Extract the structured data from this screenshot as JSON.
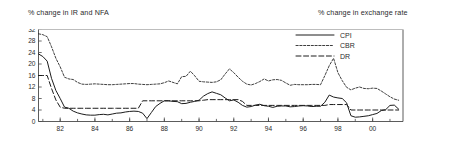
{
  "titles": {
    "left": "% change in IR and NFA",
    "right": "% change in exchange rate"
  },
  "legend": {
    "entries": [
      {
        "label": "CPI",
        "style": "solid"
      },
      {
        "label": "CBR",
        "style": "dotted-dash"
      },
      {
        "label": "DR",
        "style": "long-dash"
      }
    ]
  },
  "chart_data": {
    "type": "line",
    "title": "",
    "subtitle": "",
    "xlabel": "",
    "ylabel": "",
    "ylabel_left": "% change in IR and NFA",
    "ylabel_right": "% change in exchange rate",
    "grid": false,
    "legend_position": "top-right",
    "xlim": [
      1980.75,
      2001.75
    ],
    "ylim": [
      0,
      32
    ],
    "yticks": [
      0,
      4,
      8,
      12,
      16,
      20,
      24,
      28,
      32
    ],
    "ytick_labels": [
      "0",
      "4",
      "8",
      "12",
      "16",
      "20",
      "24",
      "28",
      "32"
    ],
    "ytick_top_clipped": true,
    "xticks": [
      1982,
      1984,
      1986,
      1988,
      1990,
      1992,
      1994,
      1996,
      1998,
      2000
    ],
    "xtick_labels": [
      "82",
      "84",
      "86",
      "88",
      "90",
      "92",
      "94",
      "96",
      "98",
      "00"
    ],
    "x": [
      1980.75,
      1981.0,
      1981.25,
      1981.5,
      1981.75,
      1982.0,
      1982.25,
      1982.5,
      1982.75,
      1983.0,
      1983.25,
      1983.5,
      1983.75,
      1984.0,
      1984.25,
      1984.5,
      1984.75,
      1985.0,
      1985.25,
      1985.5,
      1985.75,
      1986.0,
      1986.25,
      1986.5,
      1986.75,
      1987.0,
      1987.25,
      1987.5,
      1987.75,
      1988.0,
      1988.25,
      1988.5,
      1988.75,
      1989.0,
      1989.25,
      1989.5,
      1989.75,
      1990.0,
      1990.25,
      1990.5,
      1990.75,
      1991.0,
      1991.25,
      1991.5,
      1991.75,
      1992.0,
      1992.25,
      1992.5,
      1992.75,
      1993.0,
      1993.25,
      1993.5,
      1993.75,
      1994.0,
      1994.25,
      1994.5,
      1994.75,
      1995.0,
      1995.25,
      1995.5,
      1995.75,
      1996.0,
      1996.25,
      1996.5,
      1996.75,
      1997.0,
      1997.25,
      1997.5,
      1997.75,
      1998.0,
      1998.25,
      1998.5,
      1998.75,
      1999.0,
      1999.25,
      1999.5,
      1999.75,
      2000.0,
      2000.25,
      2000.5,
      2000.75,
      2001.0,
      2001.25,
      2001.5
    ],
    "series": [
      {
        "name": "CPI",
        "style": "solid",
        "values": [
          23.5,
          22.6,
          21.0,
          15.0,
          10.8,
          8.0,
          5.0,
          4.6,
          3.6,
          3.0,
          2.6,
          2.3,
          2.2,
          2.2,
          2.4,
          2.5,
          2.3,
          2.6,
          2.9,
          3.0,
          3.3,
          3.5,
          3.6,
          3.5,
          2.9,
          1.0,
          3.1,
          5.2,
          6.3,
          7.2,
          7.2,
          7.0,
          6.9,
          6.2,
          6.3,
          6.7,
          7.0,
          7.4,
          8.8,
          9.7,
          10.3,
          9.8,
          9.3,
          8.2,
          7.2,
          7.5,
          6.7,
          5.6,
          5.0,
          5.2,
          5.7,
          6.0,
          5.5,
          5.3,
          4.9,
          5.3,
          5.4,
          5.4,
          5.1,
          5.2,
          5.4,
          5.5,
          5.4,
          5.2,
          5.3,
          5.3,
          6.7,
          9.2,
          8.5,
          8.2,
          8.0,
          6.5,
          2.0,
          1.5,
          1.6,
          1.8,
          2.0,
          2.4,
          2.8,
          3.8,
          4.1,
          5.6,
          5.7,
          4.3
        ]
      },
      {
        "name": "CBR",
        "style": "dotted-dash",
        "values": [
          30.5,
          30.2,
          29.5,
          26.0,
          22.0,
          19.0,
          15.4,
          14.8,
          14.6,
          13.6,
          13.0,
          12.9,
          13.0,
          13.1,
          13.0,
          12.9,
          12.8,
          12.8,
          12.9,
          13.0,
          13.1,
          13.2,
          13.2,
          13.0,
          12.9,
          12.8,
          12.9,
          13.0,
          13.1,
          13.5,
          14.1,
          13.6,
          13.1,
          15.6,
          15.7,
          17.5,
          15.9,
          14.0,
          13.8,
          13.7,
          13.6,
          13.8,
          14.5,
          16.5,
          18.3,
          17.0,
          15.4,
          14.0,
          13.0,
          12.7,
          13.2,
          13.9,
          14.8,
          14.1,
          14.5,
          14.6,
          14.3,
          13.4,
          12.6,
          12.9,
          12.8,
          12.8,
          12.8,
          12.9,
          12.9,
          12.8,
          16.0,
          19.4,
          22.0,
          17.0,
          14.2,
          11.9,
          11.0,
          11.6,
          12.0,
          11.5,
          11.4,
          11.6,
          11.5,
          10.6,
          9.6,
          8.6,
          7.8,
          7.4
        ]
      },
      {
        "name": "DR",
        "style": "long-dash",
        "values": [
          16.0,
          16.0,
          16.0,
          11.5,
          7.5,
          5.0,
          4.6,
          4.6,
          4.6,
          4.6,
          4.6,
          4.6,
          4.6,
          4.6,
          4.6,
          4.6,
          4.6,
          4.6,
          4.6,
          4.6,
          4.6,
          4.6,
          4.6,
          4.6,
          7.2,
          7.2,
          7.2,
          7.2,
          7.2,
          7.2,
          7.2,
          7.2,
          7.2,
          7.2,
          7.2,
          7.2,
          7.2,
          7.2,
          7.4,
          7.6,
          7.6,
          7.6,
          7.6,
          7.6,
          7.6,
          7.6,
          7.6,
          7.0,
          5.6,
          5.6,
          5.6,
          5.6,
          5.6,
          5.6,
          5.6,
          5.6,
          5.6,
          5.6,
          5.6,
          5.6,
          5.6,
          5.6,
          5.6,
          5.6,
          5.6,
          5.6,
          5.6,
          5.9,
          5.9,
          5.9,
          5.9,
          5.9,
          4.0,
          4.0,
          4.0,
          4.0,
          4.0,
          4.0,
          4.0,
          4.0,
          4.0,
          4.0,
          4.0,
          4.0
        ]
      }
    ]
  }
}
